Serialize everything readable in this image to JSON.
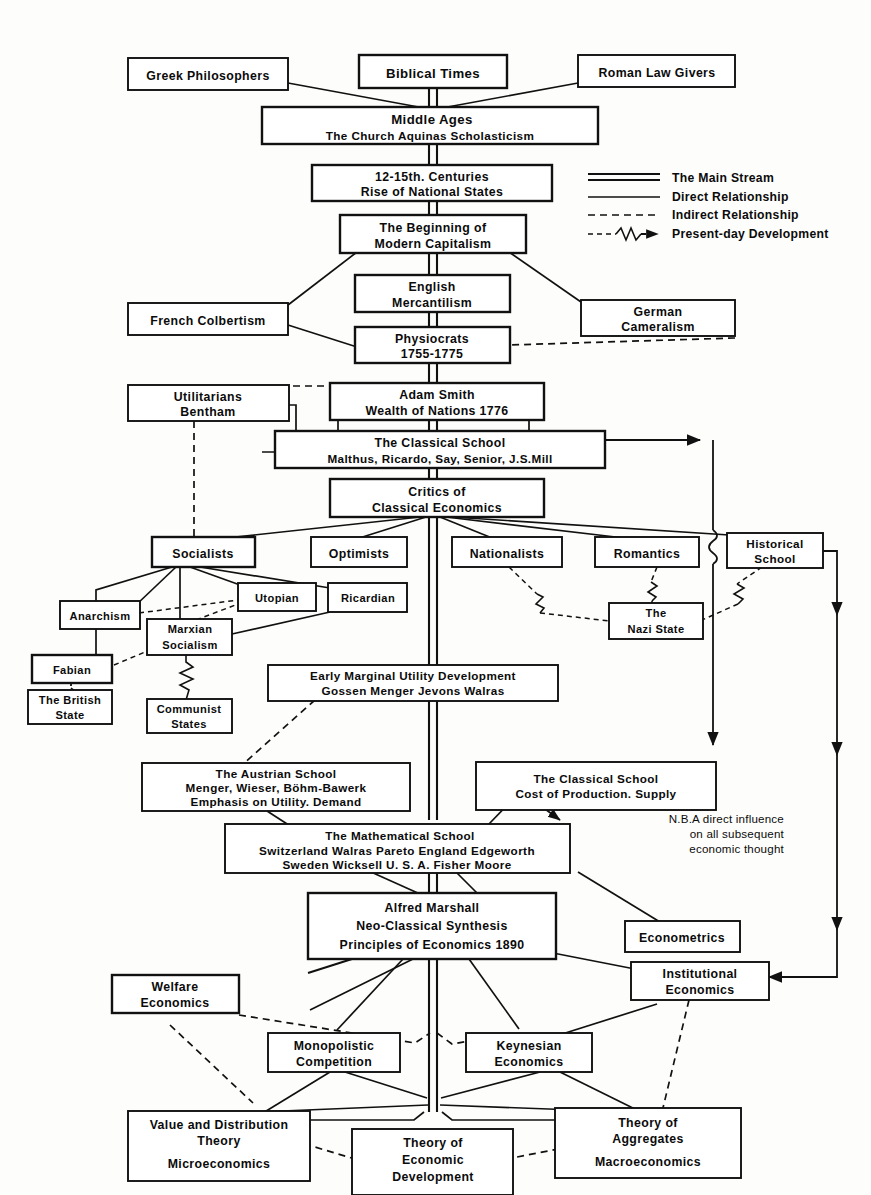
{
  "diagram": {
    "title_implied": "The Development of Economic Thought",
    "legend": {
      "items": [
        {
          "key": "main-stream",
          "label": "The Main Stream",
          "style": "double-solid-line"
        },
        {
          "key": "direct-relationship",
          "label": "Direct Relationship",
          "style": "solid-line"
        },
        {
          "key": "indirect-relationship",
          "label": "Indirect Relationship",
          "style": "dashed-line"
        },
        {
          "key": "present-day-development",
          "label": "Present-day Development",
          "style": "dashed-squiggle-arrow"
        }
      ]
    },
    "note": {
      "lines": [
        "N.B.A direct influence",
        "on all subsequent",
        "economic thought"
      ]
    },
    "nodes": [
      {
        "id": "biblical",
        "lines": [
          "Biblical Times"
        ]
      },
      {
        "id": "greek",
        "lines": [
          "Greek Philosophers"
        ]
      },
      {
        "id": "roman",
        "lines": [
          "Roman Law Givers"
        ]
      },
      {
        "id": "middle-ages",
        "lines": [
          "Middle   Ages",
          "The Church    Aquinas    Scholasticism"
        ]
      },
      {
        "id": "centuries",
        "lines": [
          "12-15th. Centuries",
          "Rise of National States"
        ]
      },
      {
        "id": "capitalism",
        "lines": [
          "The Beginning of",
          "Modern Capitalism"
        ]
      },
      {
        "id": "mercantilism",
        "lines": [
          "English",
          "Mercantilism"
        ]
      },
      {
        "id": "colbertism",
        "lines": [
          "French  Colbertism"
        ]
      },
      {
        "id": "cameralism",
        "lines": [
          "German",
          "Cameralism"
        ]
      },
      {
        "id": "physiocrats",
        "lines": [
          "Physiocrats",
          "1755-1775"
        ]
      },
      {
        "id": "utilitarians",
        "lines": [
          "Utilitarians",
          "Bentham"
        ]
      },
      {
        "id": "adam-smith",
        "lines": [
          "Adam  Smith",
          "Wealth of Nations 1776"
        ]
      },
      {
        "id": "classical",
        "lines": [
          "The Classical School",
          "Malthus, Ricardo, Say, Senior,  J.S.Mill"
        ]
      },
      {
        "id": "critics",
        "lines": [
          "Critics  of",
          "Classical  Economics"
        ]
      },
      {
        "id": "socialists",
        "lines": [
          "Socialists"
        ]
      },
      {
        "id": "optimists",
        "lines": [
          "Optimists"
        ]
      },
      {
        "id": "nationalists",
        "lines": [
          "Nationalists"
        ]
      },
      {
        "id": "romantics",
        "lines": [
          "Romantics"
        ]
      },
      {
        "id": "historical",
        "lines": [
          "Historical",
          "School"
        ]
      },
      {
        "id": "anarchism",
        "lines": [
          "Anarchism"
        ]
      },
      {
        "id": "utopian",
        "lines": [
          "Utopian"
        ]
      },
      {
        "id": "ricardian",
        "lines": [
          "Ricardian"
        ]
      },
      {
        "id": "marxian",
        "lines": [
          "Marxian",
          "Socialism"
        ]
      },
      {
        "id": "fabian",
        "lines": [
          "Fabian"
        ]
      },
      {
        "id": "nazi-state",
        "lines": [
          "The",
          "Nazi State"
        ]
      },
      {
        "id": "british-state",
        "lines": [
          "The British",
          "State"
        ]
      },
      {
        "id": "communist",
        "lines": [
          "Communist",
          "States"
        ]
      },
      {
        "id": "marginal",
        "lines": [
          "Early  Marginal  Utility Development",
          "Gossen    Menger    Jevons    Walras"
        ]
      },
      {
        "id": "austrian",
        "lines": [
          "The  Austrian  School",
          "Menger, Wieser, Böhm-Bawerk",
          "Emphasis on Utility.     Demand"
        ]
      },
      {
        "id": "classical2",
        "lines": [
          "The Classical  School",
          "Cost of Production.          Supply"
        ]
      },
      {
        "id": "mathematical",
        "lines": [
          "The Mathematical  School",
          "Switzerland   Walras    Pareto  England  Edgeworth",
          "Sweden      Wicksell      U. S. A.     Fisher    Moore"
        ]
      },
      {
        "id": "marshall",
        "lines": [
          "Alfred  Marshall",
          "Neo-Classical  Synthesis",
          "Principles of Economics  1890"
        ]
      },
      {
        "id": "econometrics",
        "lines": [
          "Econometrics"
        ]
      },
      {
        "id": "welfare",
        "lines": [
          "Welfare",
          "Economics"
        ]
      },
      {
        "id": "institutional",
        "lines": [
          "Institutional",
          "Economics"
        ]
      },
      {
        "id": "monopolistic",
        "lines": [
          "Monopolistic",
          "Competition"
        ]
      },
      {
        "id": "keynesian",
        "lines": [
          "Keynesian",
          "Economics"
        ]
      },
      {
        "id": "value-dist",
        "lines": [
          "Value and Distribution",
          "Theory",
          "Microeconomics"
        ]
      },
      {
        "id": "theory-econ-dev",
        "lines": [
          "Theory of",
          "Economic",
          "Development"
        ]
      },
      {
        "id": "aggregates",
        "lines": [
          "Theory of",
          "Aggregates",
          "Macroeconomics"
        ]
      }
    ],
    "colors": {
      "background": "#fdfdfb",
      "ink": "#111111",
      "box_fill": "#ffffff"
    }
  }
}
